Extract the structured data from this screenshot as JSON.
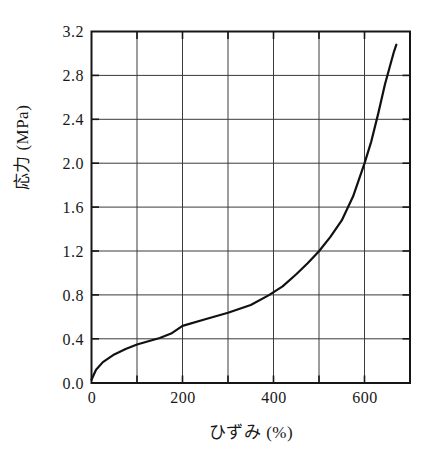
{
  "chart_data": {
    "type": "line",
    "title": "",
    "xlabel": "ひずみ (%)",
    "ylabel": "応力 (MPa)",
    "xlim": [
      0,
      700
    ],
    "ylim": [
      0.0,
      3.2
    ],
    "grid": true,
    "legend": "none",
    "x_ticks": [
      0,
      100,
      200,
      300,
      400,
      500,
      600,
      700
    ],
    "x_tick_labels": [
      "0",
      "",
      "200",
      "",
      "400",
      "",
      "600",
      ""
    ],
    "y_ticks": [
      0.0,
      0.4,
      0.8,
      1.2,
      1.6,
      2.0,
      2.4,
      2.8,
      3.2
    ],
    "y_tick_labels": [
      "0.0",
      "0.4",
      "0.8",
      "1.2",
      "1.6",
      "2.0",
      "2.4",
      "2.8",
      "3.2"
    ],
    "line_color": "#111111",
    "series": [
      {
        "name": "stress-strain",
        "x": [
          0,
          10,
          25,
          50,
          75,
          100,
          125,
          150,
          175,
          200,
          250,
          300,
          350,
          390,
          420,
          450,
          475,
          500,
          525,
          550,
          575,
          600,
          615,
          630,
          645,
          655,
          665,
          670
        ],
        "y": [
          0.03,
          0.12,
          0.19,
          0.26,
          0.31,
          0.35,
          0.38,
          0.41,
          0.45,
          0.52,
          0.58,
          0.64,
          0.71,
          0.8,
          0.88,
          0.99,
          1.09,
          1.2,
          1.33,
          1.48,
          1.7,
          2.0,
          2.2,
          2.45,
          2.72,
          2.87,
          3.02,
          3.08
        ]
      }
    ],
    "annotations": []
  },
  "axis": {
    "y_label": "応力 (MPa)",
    "x_label": "ひずみ (%)"
  }
}
